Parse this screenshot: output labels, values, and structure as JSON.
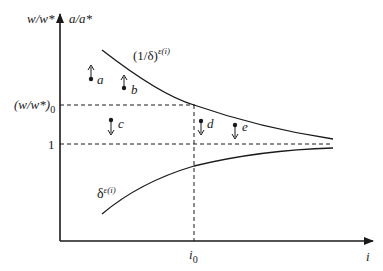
{
  "diagram": {
    "y_axis_label_left": "w/w*",
    "y_axis_label_right": "a/a*",
    "x_axis_label": "i",
    "y_ticks": {
      "w0": {
        "base": "(w/w*)",
        "sub": "0"
      },
      "one": "1"
    },
    "x_ticks": {
      "i0": {
        "base": "i",
        "sub": "0"
      }
    },
    "curves": {
      "upper": {
        "base": "(1/δ)",
        "sup": "ε(i)"
      },
      "lower": {
        "base": "δ",
        "sup": "ε(i)"
      }
    },
    "points": [
      {
        "label": "a",
        "direction": "up"
      },
      {
        "label": "b",
        "direction": "up"
      },
      {
        "label": "c",
        "direction": "down"
      },
      {
        "label": "d",
        "direction": "down"
      },
      {
        "label": "e",
        "direction": "down"
      }
    ],
    "colors": {
      "ink": "#1a1a1a",
      "background": "#ffffff"
    }
  }
}
